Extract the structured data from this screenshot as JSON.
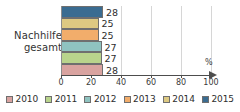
{
  "chart_data": {
    "type": "bar",
    "orientation": "horizontal",
    "title": "",
    "xlabel": "%",
    "ylabel": "",
    "categories": [
      "Nachhilfe gesamt"
    ],
    "category_label_line1": "Nachhilfe",
    "category_label_line2": "gesamt",
    "xlim": [
      0,
      100
    ],
    "xticks": [
      0,
      20,
      40,
      60,
      80,
      100
    ],
    "xtick_labels": [
      "0",
      "20",
      "40",
      "60",
      "80",
      "100"
    ],
    "grid": true,
    "grid_axis": "x",
    "legend_position": "bottom",
    "axis_unit": "%",
    "series": [
      {
        "name": "2010",
        "values": [
          28
        ],
        "color": "#d9a3a0",
        "label": "28"
      },
      {
        "name": "2011",
        "values": [
          27
        ],
        "color": "#b9d48c",
        "label": "27"
      },
      {
        "name": "2012",
        "values": [
          27
        ],
        "color": "#8fc3c0",
        "label": "27"
      },
      {
        "name": "2013",
        "values": [
          25
        ],
        "color": "#f2ad6b",
        "label": "25"
      },
      {
        "name": "2014",
        "values": [
          25
        ],
        "color": "#ddc982",
        "label": "25"
      },
      {
        "name": "2015",
        "values": [
          28
        ],
        "color": "#3a6c91",
        "label": "28"
      }
    ],
    "bars_top_to_bottom": [
      {
        "year": "2015",
        "value": 28,
        "label": "28",
        "color": "#3a6c91"
      },
      {
        "year": "2014",
        "value": 25,
        "label": "25",
        "color": "#ddc982"
      },
      {
        "year": "2013",
        "value": 25,
        "label": "25",
        "color": "#f2ad6b"
      },
      {
        "year": "2012",
        "value": 27,
        "label": "27",
        "color": "#8fc3c0"
      },
      {
        "year": "2011",
        "value": 27,
        "label": "27",
        "color": "#b9d48c"
      },
      {
        "year": "2010",
        "value": 28,
        "label": "28",
        "color": "#d9a3a0"
      }
    ]
  },
  "legend": {
    "items": [
      {
        "label": "2010",
        "color": "#d9a3a0"
      },
      {
        "label": "2011",
        "color": "#b9d48c"
      },
      {
        "label": "2012",
        "color": "#8fc3c0"
      },
      {
        "label": "2013",
        "color": "#f2ad6b"
      },
      {
        "label": "2014",
        "color": "#ddc982"
      },
      {
        "label": "2015",
        "color": "#3a6c91"
      }
    ]
  },
  "axis": {
    "ticks": [
      "0",
      "20",
      "40",
      "60",
      "80",
      "100"
    ],
    "unit": "%"
  }
}
